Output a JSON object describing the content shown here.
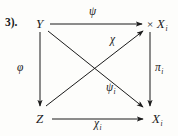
{
  "figure": {
    "item_number": "3).",
    "background_color": "#fdfdfb",
    "ink_color": "#1b1b1b",
    "width": 178,
    "height": 136
  },
  "objects": {
    "top_left": {
      "name": "Y",
      "index": ""
    },
    "top_right": {
      "prod": "×",
      "name": "X",
      "index": "i"
    },
    "bottom_left": {
      "name": "Z",
      "index": ""
    },
    "bottom_right": {
      "name": "X",
      "index": "i"
    }
  },
  "morphisms": {
    "top": {
      "name": "ψ",
      "index": "",
      "from": "Y",
      "to": "× X_i"
    },
    "left": {
      "name": "φ",
      "index": "",
      "from": "Y",
      "to": "Z"
    },
    "right": {
      "name": "π",
      "index": "i",
      "from": "× X_i",
      "to": "X_i"
    },
    "bottom": {
      "name": "χ",
      "index": "i",
      "from": "Z",
      "to": "X_i"
    },
    "diag_up": {
      "name": "χ",
      "index": "",
      "from": "Z",
      "to": "× X_i"
    },
    "diag_down": {
      "name": "ψ",
      "index": "i",
      "from": "Y",
      "to": "X_i"
    }
  }
}
